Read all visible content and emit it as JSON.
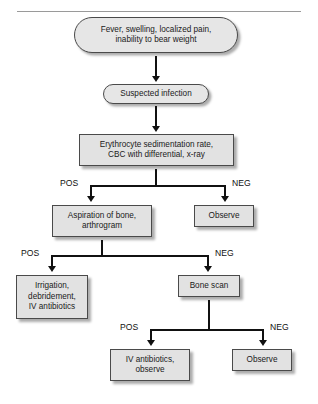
{
  "figure": {
    "divider": "horizontal-rule",
    "accent_color": "#e2e2e2",
    "line_color": "#111111",
    "border_color": "#4a4a4a"
  },
  "nodes": {
    "presentation": "Fever, swelling, localized pain,\ninability to bear weight",
    "suspected": "Suspected infection",
    "workup": "Erythrocyte sedimentation rate,\nCBC with differential, x-ray",
    "aspiration": "Aspiration of bone,\narthrogram",
    "observe_1": "Observe",
    "irrigation": "Irrigation,\ndebridement,\nIV antibiotics",
    "bone_scan": "Bone scan",
    "iv_observe": "IV antibiotics,\nobserve",
    "observe_2": "Observe"
  },
  "branches": {
    "workup": {
      "pos": "POS",
      "neg": "NEG"
    },
    "aspiration": {
      "pos": "POS",
      "neg": "NEG"
    },
    "bone_scan": {
      "pos": "POS",
      "neg": "NEG"
    }
  }
}
